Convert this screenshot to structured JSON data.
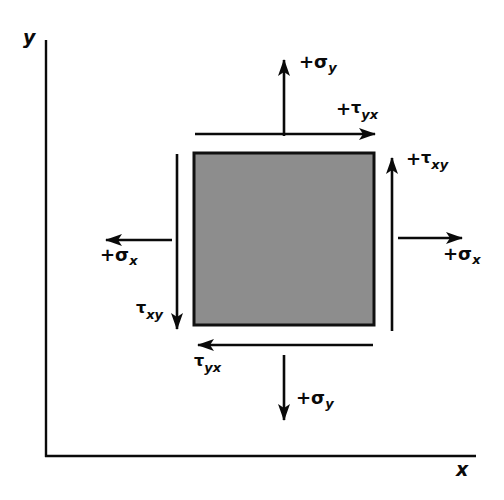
{
  "figure": {
    "type": "engineering-stress-element-diagram",
    "background_color": "#ffffff",
    "line_color": "#0a0a0a"
  },
  "axes": {
    "y_label": "y",
    "x_label": "x",
    "origin": {
      "x": 46,
      "y": 456
    },
    "y_axis_top": 40,
    "x_axis_right": 476,
    "stroke_width": 2
  },
  "element": {
    "name": "stress-element-square",
    "fill_color": "#8d8d8d",
    "border_color": "#101010",
    "border_width": 3,
    "left": 194,
    "top": 153,
    "right": 374,
    "bottom": 325,
    "width": 180,
    "height": 172
  },
  "labels": {
    "sigma_y_top": {
      "sign": "+",
      "symbol": "σ",
      "subscript": "y",
      "x": 299,
      "y": 53
    },
    "tau_yx_top": {
      "sign": "+",
      "symbol": "τ",
      "subscript": "yx",
      "x": 336,
      "y": 100
    },
    "tau_xy_right": {
      "sign": "+",
      "symbol": "τ",
      "subscript": "xy",
      "x": 406,
      "y": 150
    },
    "sigma_x_right": {
      "sign": "+",
      "symbol": "σ",
      "subscript": "x",
      "x": 443,
      "y": 245
    },
    "sigma_x_left": {
      "sign": "+",
      "symbol": "σ",
      "subscript": "x",
      "x": 100,
      "y": 246
    },
    "tau_xy_left": {
      "sign": "",
      "symbol": "τ",
      "subscript": "xy",
      "x": 136,
      "y": 300
    },
    "tau_yx_bottom": {
      "sign": "",
      "symbol": "τ",
      "subscript": "yx",
      "x": 194,
      "y": 353
    },
    "sigma_y_bottom": {
      "sign": "+",
      "symbol": "σ",
      "subscript": "y",
      "x": 296,
      "y": 389
    }
  },
  "arrows": [
    {
      "name": "sigma-y-top-arrow",
      "label": "+σy",
      "direction": "up",
      "x1": 284,
      "y1": 136,
      "x2": 284,
      "y2": 58,
      "stroke_width": 3
    },
    {
      "name": "tau-yx-top-arrow",
      "label": "+τyx",
      "direction": "right",
      "x1": 195,
      "y1": 134,
      "x2": 377,
      "y2": 134,
      "stroke_width": 3
    },
    {
      "name": "tau-xy-right-arrow",
      "label": "+τxy",
      "direction": "up",
      "x1": 392,
      "y1": 331,
      "x2": 392,
      "y2": 155,
      "stroke_width": 3
    },
    {
      "name": "sigma-x-right-arrow",
      "label": "+σx",
      "direction": "right",
      "x1": 398,
      "y1": 238,
      "x2": 464,
      "y2": 238,
      "stroke_width": 3
    },
    {
      "name": "sigma-x-left-arrow",
      "label": "+σx",
      "direction": "left",
      "x1": 172,
      "y1": 240,
      "x2": 104,
      "y2": 240,
      "stroke_width": 3
    },
    {
      "name": "tau-xy-left-arrow",
      "label": "τxy",
      "direction": "down",
      "x1": 177,
      "y1": 154,
      "x2": 177,
      "y2": 331,
      "stroke_width": 3
    },
    {
      "name": "tau-yx-bottom-arrow",
      "label": "τyx",
      "direction": "left",
      "x1": 374,
      "y1": 345,
      "x2": 194,
      "y2": 345,
      "stroke_width": 3
    },
    {
      "name": "sigma-y-bottom-arrow",
      "label": "+σy",
      "direction": "down",
      "x1": 284,
      "y1": 355,
      "x2": 284,
      "y2": 422,
      "stroke_width": 3
    }
  ]
}
